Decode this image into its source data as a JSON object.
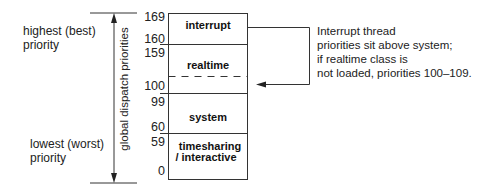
{
  "diagram": {
    "top_label": "highest (best)\npriority",
    "top_label_lines": [
      "highest (best)",
      "priority"
    ],
    "bottom_label_lines": [
      "lowest (worst)",
      "priority"
    ],
    "axis_label": "global dispatch priorities",
    "priority_numbers": [
      "169",
      "160",
      "159",
      "100",
      "99",
      "60",
      "59",
      "0"
    ],
    "classes": [
      {
        "name": "interrupt",
        "range": [
          160,
          169
        ]
      },
      {
        "name": "realtime",
        "range": [
          100,
          159
        ]
      },
      {
        "name": "system",
        "range": [
          60,
          99
        ]
      },
      {
        "name_lines": [
          "timesharing",
          "/ interactive"
        ],
        "range": [
          0,
          59
        ]
      }
    ],
    "class_labels": {
      "interrupt": "interrupt",
      "realtime": "realtime",
      "system": "system",
      "timesharing_line1": "timesharing",
      "timesharing_line2": "/ interactive"
    },
    "note_lines": [
      "Interrupt thread",
      "priorities sit above system;",
      "if realtime class is",
      "not loaded, priorities 100–109."
    ],
    "colors": {
      "line": "#333333",
      "text": "#222222",
      "background": "#ffffff"
    }
  }
}
